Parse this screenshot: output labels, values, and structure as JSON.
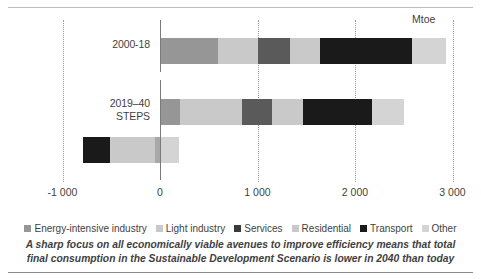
{
  "chart_data": {
    "type": "bar",
    "orientation": "horizontal",
    "stacked": true,
    "title": "",
    "xlabel": "Mtoe",
    "ylabel": "",
    "unit": "Mtoe",
    "xlim": [
      -1000,
      3000
    ],
    "xticks": [
      -1000,
      0,
      1000,
      2000,
      3000
    ],
    "xticklabels": [
      "-1 000",
      "0",
      "1 000",
      "2 000",
      "3 000"
    ],
    "grid": true,
    "legend_position": "bottom",
    "categories": [
      "2000-18",
      "2019-40\nSTEPS",
      "2019-40\nSDS"
    ],
    "category_labels": [
      {
        "line1": "2000-18",
        "line2": ""
      },
      {
        "line1": "2019–40",
        "line2": "STEPS"
      },
      {
        "line1": "2019–40",
        "line2": "SDS"
      }
    ],
    "series": [
      {
        "name": "Energy-intensive industry",
        "color": "#969696",
        "values": [
          595,
          205,
          0
        ]
      },
      {
        "name": "Light industry",
        "color": "#c9c9c9",
        "values": [
          410,
          635,
          460
        ]
      },
      {
        "name": "Services",
        "color": "#5a5a5a",
        "values": [
          330,
          310,
          50
        ]
      },
      {
        "name": "Residential",
        "color": "#c9c9c9",
        "values": [
          305,
          315,
          0
        ]
      },
      {
        "name": "Transport",
        "color": "#1a1a1a",
        "values": [
          945,
          710,
          -790
        ]
      },
      {
        "name": "Other",
        "color": "#d4d4d4",
        "values": [
          350,
          330,
          190
        ]
      }
    ],
    "totals": [
      2935,
      2505,
      -90
    ],
    "bars": [
      {
        "category": "2000-18",
        "segments": [
          {
            "name": "Energy-intensive industry",
            "start": 0,
            "end": 595,
            "value": 595,
            "color": "#969696"
          },
          {
            "name": "Light industry",
            "start": 595,
            "end": 1005,
            "value": 410,
            "color": "#c9c9c9"
          },
          {
            "name": "Services",
            "start": 1005,
            "end": 1335,
            "value": 330,
            "color": "#5a5a5a"
          },
          {
            "name": "Residential",
            "start": 1335,
            "end": 1640,
            "value": 305,
            "color": "#c9c9c9"
          },
          {
            "name": "Transport",
            "start": 1640,
            "end": 2585,
            "value": 945,
            "color": "#1a1a1a"
          },
          {
            "name": "Other",
            "start": 2585,
            "end": 2935,
            "value": 350,
            "color": "#d4d4d4"
          }
        ]
      },
      {
        "category": "2019-40 STEPS",
        "segments": [
          {
            "name": "Energy-intensive industry",
            "start": 0,
            "end": 205,
            "value": 205,
            "color": "#969696"
          },
          {
            "name": "Light industry",
            "start": 205,
            "end": 840,
            "value": 635,
            "color": "#c9c9c9"
          },
          {
            "name": "Services",
            "start": 840,
            "end": 1150,
            "value": 310,
            "color": "#5a5a5a"
          },
          {
            "name": "Residential",
            "start": 1150,
            "end": 1465,
            "value": 315,
            "color": "#c9c9c9"
          },
          {
            "name": "Transport",
            "start": 1465,
            "end": 2175,
            "value": 710,
            "color": "#1a1a1a"
          },
          {
            "name": "Other",
            "start": 2175,
            "end": 2505,
            "value": 330,
            "color": "#d4d4d4"
          }
        ]
      },
      {
        "category": "2019-40 SDS",
        "segments": [
          {
            "name": "Transport",
            "start": -790,
            "end": -515,
            "value": -275,
            "color": "#1a1a1a"
          },
          {
            "name": "Light industry",
            "start": -515,
            "end": -55,
            "value": 460,
            "color": "#c9c9c9"
          },
          {
            "name": "Services",
            "start": -55,
            "end": -5,
            "value": 50,
            "color": "#a8a8a8"
          },
          {
            "name": "Other",
            "start": -5,
            "end": 190,
            "value": 195,
            "color": "#d4d4d4"
          }
        ]
      }
    ]
  },
  "legend": {
    "items": [
      {
        "label": "Energy-intensive industry",
        "color": "#969696"
      },
      {
        "label": "Light industry",
        "color": "#c9c9c9"
      },
      {
        "label": "Services",
        "color": "#3a3a3a"
      },
      {
        "label": "Residential",
        "color": "#c9c9c9"
      },
      {
        "label": "Transport",
        "color": "#1a1a1a"
      },
      {
        "label": "Other",
        "color": "#d4d4d4"
      }
    ]
  },
  "caption": {
    "line1": "A sharp focus on all economically viable avenues to improve efficiency means that total",
    "line2": "final consumption in the Sustainable Development Scenario is lower in 2040 than today"
  }
}
